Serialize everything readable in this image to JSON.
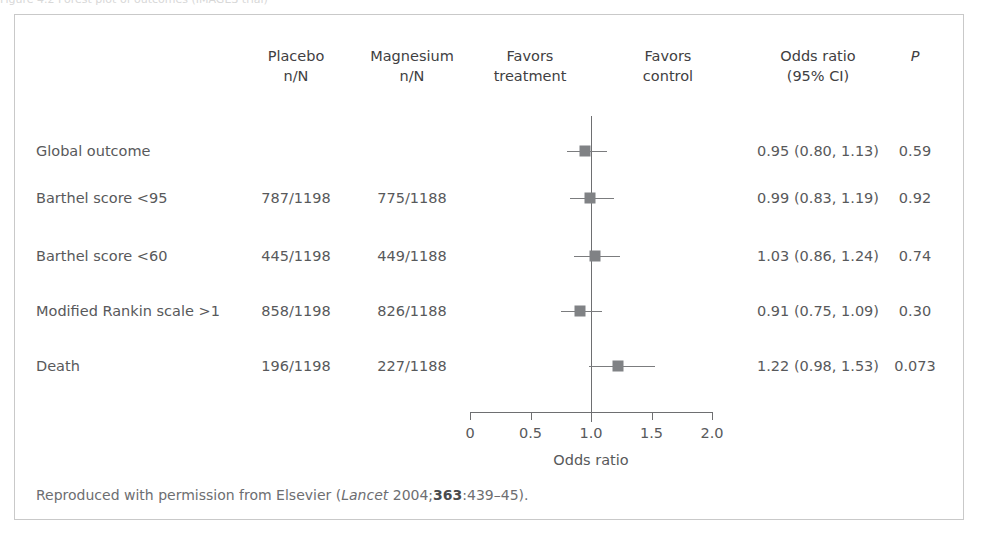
{
  "figure": {
    "top_clip_text": "Figure 4.2  Forest plot of outcomes (IMAGES trial)",
    "footnote": {
      "prefix": "Reproduced with permission from Elsevier (",
      "journal": "Lancet",
      "year": " 2004;",
      "volume": "363",
      "pages": ":439–45)."
    }
  },
  "columns": {
    "outcome": {
      "label": "",
      "x": 36
    },
    "placebo": {
      "line1": "Placebo",
      "line2": "n/N",
      "x": 296
    },
    "magnesium": {
      "line1": "Magnesium",
      "line2": "n/N",
      "x": 412
    },
    "favors_treatment": {
      "line1": "Favors",
      "line2": "treatment",
      "x": 530
    },
    "favors_control": {
      "line1": "Favors",
      "line2": "control",
      "x": 668
    },
    "odds_ratio": {
      "line1": "Odds ratio",
      "line2": "(95% CI)",
      "x": 818
    },
    "pvalue": {
      "line1": "P",
      "line2": "",
      "x": 915
    }
  },
  "axis": {
    "title": "Odds ratio",
    "ticks": [
      "0",
      "0.5",
      "1.0",
      "1.5",
      "2.0"
    ],
    "tick_values": [
      0,
      0.5,
      1.0,
      1.5,
      2.0
    ],
    "min": 0,
    "max": 2.0,
    "reference": 1.0
  },
  "chart_data": {
    "type": "forest",
    "title": "",
    "xlabel": "Odds ratio",
    "ylabel": "",
    "xlim": [
      0,
      2.0
    ],
    "reference_line": 1.0,
    "xticks": [
      0,
      0.5,
      1.0,
      1.5,
      2.0
    ],
    "xticklabels": [
      "0",
      "0.5",
      "1.0",
      "1.5",
      "2.0"
    ],
    "grid": false,
    "legend": "none",
    "columns": [
      "Outcome",
      "Placebo n/N",
      "Magnesium n/N",
      "Odds ratio (95% CI)",
      "P"
    ],
    "rows": [
      {
        "outcome": "Global outcome",
        "placebo": "",
        "magnesium": "",
        "estimate": 0.95,
        "ci_low": 0.8,
        "ci_high": 1.13,
        "or_text": "0.95 (0.80, 1.13)",
        "p": "0.59",
        "marker_size": 11
      },
      {
        "outcome": "Barthel score <95",
        "placebo": "787/1198",
        "magnesium": "775/1188",
        "estimate": 0.99,
        "ci_low": 0.83,
        "ci_high": 1.19,
        "or_text": "0.99 (0.83, 1.19)",
        "p": "0.92",
        "marker_size": 11
      },
      {
        "outcome": "Barthel score <60",
        "placebo": "445/1198",
        "magnesium": "449/1188",
        "estimate": 1.03,
        "ci_low": 0.86,
        "ci_high": 1.24,
        "or_text": "1.03 (0.86, 1.24)",
        "p": "0.74",
        "marker_size": 11
      },
      {
        "outcome": "Modified Rankin scale >1",
        "placebo": "858/1198",
        "magnesium": "826/1188",
        "estimate": 0.91,
        "ci_low": 0.75,
        "ci_high": 1.09,
        "or_text": "0.91 (0.75, 1.09)",
        "p": "0.30",
        "marker_size": 11
      },
      {
        "outcome": "Death",
        "placebo": "196/1198",
        "magnesium": "227/1188",
        "estimate": 1.22,
        "ci_low": 0.98,
        "ci_high": 1.53,
        "or_text": "1.22 (0.98, 1.53)",
        "p": "0.073",
        "marker_size": 11
      }
    ]
  },
  "colors": {
    "marker": "#808285",
    "line": "#6e6f71",
    "text": "#58595b",
    "border": "#c9c9c9",
    "background": "#ffffff"
  }
}
